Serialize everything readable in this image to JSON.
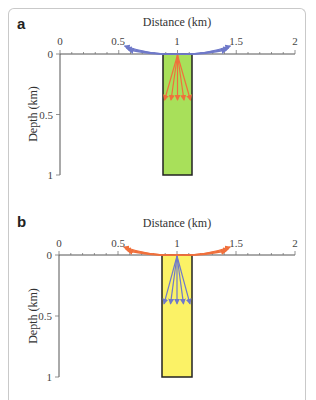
{
  "figure": {
    "panels": [
      {
        "label": "a",
        "x_axis_title": "Distance (km)",
        "y_axis_title": "Depth (km)",
        "x_ticks": [
          "0",
          "0.5",
          "1",
          "1.5",
          "2"
        ],
        "y_ticks": [
          "0",
          "0.5",
          "1"
        ],
        "column_fill": "#a8e05a",
        "surface_arrow_color": "#6f79c9",
        "down_arrow_color": "#f0703c"
      },
      {
        "label": "b",
        "x_axis_title": "Distance (km)",
        "y_axis_title": "Depth (km)",
        "x_ticks": [
          "0",
          "0.5",
          "1",
          "1.5",
          "2"
        ],
        "y_ticks": [
          "0",
          "0.5",
          "1"
        ],
        "column_fill": "#fbf266",
        "surface_arrow_color": "#f0703c",
        "down_arrow_color": "#6f79c9"
      }
    ]
  },
  "chart_data": [
    {
      "type": "diagram",
      "panel": "a",
      "xlabel": "Distance (km)",
      "ylabel": "Depth (km)",
      "xlim": [
        0,
        2
      ],
      "ylim": [
        1,
        0
      ],
      "column": {
        "x_range": [
          0.88,
          1.12
        ],
        "depth_range": [
          0,
          1
        ],
        "fill": "green"
      },
      "surface_arrows": {
        "color": "blue",
        "origin": [
          1,
          0
        ],
        "targets_x": [
          0.55,
          1.45
        ],
        "count_each_side": 3
      },
      "downward_arrows": {
        "color": "orange",
        "origin": [
          1,
          0
        ],
        "tip_depth": 0.38,
        "tips_x": [
          0.89,
          0.945,
          1.0,
          1.055,
          1.11
        ]
      }
    },
    {
      "type": "diagram",
      "panel": "b",
      "xlabel": "Distance (km)",
      "ylabel": "Depth (km)",
      "xlim": [
        0,
        2
      ],
      "ylim": [
        1,
        0
      ],
      "column": {
        "x_range": [
          0.88,
          1.12
        ],
        "depth_range": [
          0,
          1
        ],
        "fill": "yellow"
      },
      "surface_arrows": {
        "color": "orange",
        "origin": [
          1,
          0
        ],
        "targets_x": [
          0.55,
          1.45
        ],
        "count_each_side": 3
      },
      "downward_arrows": {
        "color": "blue",
        "origin": [
          1,
          0
        ],
        "tip_depth": 0.4,
        "tips_x": [
          0.89,
          0.945,
          1.0,
          1.055,
          1.11
        ]
      }
    }
  ]
}
